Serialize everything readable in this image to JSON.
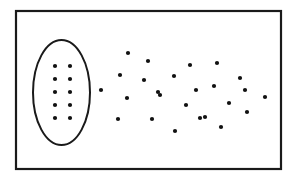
{
  "figure": {
    "title": "",
    "background_color": "#ffffff",
    "stroke_color": "#1a1a1a",
    "dot_color": "#111111",
    "dot_radius": 2.1,
    "frame": {
      "label": "outer-rectangle",
      "x": 16,
      "y": 11,
      "width": 265,
      "height": 158,
      "stroke_width": 2.2
    },
    "cluster_region": {
      "label": "ellipse-outline",
      "cx": 61.5,
      "cy": 92.5,
      "rx": 28.5,
      "ry": 52.5,
      "stroke_width": 2.0
    },
    "cluster_dots": {
      "label": "ordered-grid-dots",
      "count": 10,
      "columns": 2,
      "rows": 5,
      "points": [
        {
          "x": 55,
          "y": 66
        },
        {
          "x": 70,
          "y": 66
        },
        {
          "x": 55,
          "y": 79
        },
        {
          "x": 70,
          "y": 79
        },
        {
          "x": 55,
          "y": 92
        },
        {
          "x": 70,
          "y": 92
        },
        {
          "x": 55,
          "y": 105
        },
        {
          "x": 70,
          "y": 105
        },
        {
          "x": 55,
          "y": 118
        },
        {
          "x": 70,
          "y": 118
        }
      ]
    },
    "scatter_dots": {
      "label": "scattered-dots",
      "count": 25,
      "points": [
        {
          "x": 101,
          "y": 90
        },
        {
          "x": 128,
          "y": 53
        },
        {
          "x": 148,
          "y": 61
        },
        {
          "x": 120,
          "y": 75
        },
        {
          "x": 144,
          "y": 80
        },
        {
          "x": 127,
          "y": 98
        },
        {
          "x": 118,
          "y": 119
        },
        {
          "x": 152,
          "y": 119
        },
        {
          "x": 160,
          "y": 95
        },
        {
          "x": 174,
          "y": 76
        },
        {
          "x": 190,
          "y": 65
        },
        {
          "x": 196,
          "y": 90
        },
        {
          "x": 175,
          "y": 131
        },
        {
          "x": 205,
          "y": 117
        },
        {
          "x": 217,
          "y": 63
        },
        {
          "x": 240,
          "y": 78
        },
        {
          "x": 214,
          "y": 86
        },
        {
          "x": 229,
          "y": 103
        },
        {
          "x": 247,
          "y": 112
        },
        {
          "x": 221,
          "y": 127
        },
        {
          "x": 265,
          "y": 97
        },
        {
          "x": 158,
          "y": 92
        },
        {
          "x": 186,
          "y": 105
        },
        {
          "x": 200,
          "y": 118
        },
        {
          "x": 245,
          "y": 90
        }
      ]
    }
  }
}
